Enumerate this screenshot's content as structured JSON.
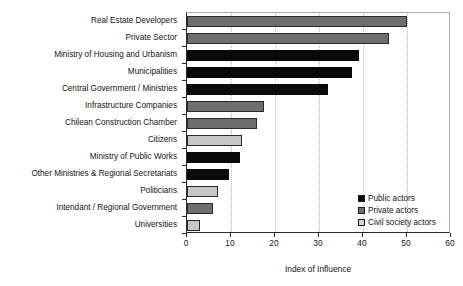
{
  "chart_data": {
    "type": "bar",
    "orientation": "horizontal",
    "title": "",
    "xlabel": "Index of Influence",
    "ylabel": "",
    "xlim": [
      0,
      60
    ],
    "xticks": [
      0,
      10,
      20,
      30,
      40,
      50,
      60
    ],
    "grid": "vertical-dotted",
    "legend_position": "bottom-right",
    "categories": [
      "Real Estate Developers",
      "Private Sector",
      "Ministry of Housing and Urbanism",
      "Municipalities",
      "Central Government / Ministries",
      "Infrastructure Companies",
      "Chilean Construction Chamber",
      "Citizens",
      "Ministry of Public Works",
      "Other Ministries & Regional Secretariats",
      "Politicians",
      "Intendant / Regional Government",
      "Universities"
    ],
    "values": [
      50,
      46,
      39,
      37.5,
      32,
      17.5,
      16,
      12.5,
      12,
      9.5,
      7,
      6,
      3
    ],
    "groups": [
      "private",
      "private",
      "public",
      "public",
      "public",
      "private",
      "private",
      "civil",
      "public",
      "public",
      "civil",
      "private",
      "civil"
    ],
    "legend": [
      {
        "key": "public",
        "label": "Public actors",
        "color": "#0a0a0a"
      },
      {
        "key": "private",
        "label": "Private actors",
        "color": "#6e6e6e"
      },
      {
        "key": "civil",
        "label": "Civil society actors",
        "color": "#d2d2d2"
      }
    ]
  }
}
